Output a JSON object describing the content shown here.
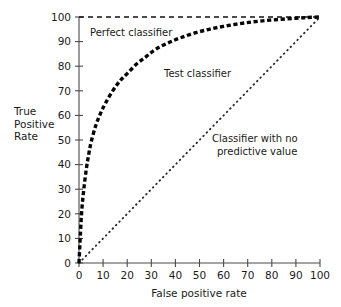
{
  "chart_data": {
    "type": "line",
    "title": "",
    "xlabel": "False positive rate",
    "ylabel": "True Positive Rate",
    "ylabel_lines": [
      "True",
      "Positive",
      "Rate"
    ],
    "xlim": [
      0,
      100
    ],
    "ylim": [
      0,
      100
    ],
    "xticks": [
      0,
      10,
      20,
      30,
      40,
      50,
      60,
      70,
      80,
      90,
      100
    ],
    "yticks": [
      0,
      10,
      20,
      30,
      40,
      50,
      60,
      70,
      80,
      90,
      100
    ],
    "xtick_labels": [
      "0",
      "10",
      "20",
      "30",
      "40",
      "50",
      "60",
      "70",
      "80",
      "90",
      "100"
    ],
    "ytick_labels": [
      "0",
      "10",
      "20",
      "30",
      "40",
      "50",
      "60",
      "70",
      "80",
      "90",
      "100"
    ],
    "grid": false,
    "legend_position": "inline-annotations",
    "series": [
      {
        "name": "Perfect classifier",
        "style": "dashed",
        "color": "#111111",
        "x": [
          0,
          100
        ],
        "y": [
          100,
          100
        ]
      },
      {
        "name": "Test classifier",
        "style": "thick-dashed",
        "color": "#050505",
        "x": [
          0,
          0.6,
          1.2,
          2,
          3,
          4,
          5,
          7,
          9,
          11,
          14,
          17,
          20,
          24,
          28,
          32,
          37,
          42,
          48,
          54,
          60,
          66,
          72,
          78,
          84,
          90,
          95,
          100
        ],
        "y": [
          0,
          12,
          22,
          30,
          38,
          44,
          49,
          56,
          61,
          65,
          70,
          74,
          77,
          81,
          84,
          87,
          89.5,
          91.5,
          93.5,
          95,
          96.2,
          97.2,
          98,
          98.6,
          99.1,
          99.5,
          99.8,
          100
        ]
      },
      {
        "name": "Classifier with no predictive value",
        "style": "dotted",
        "color": "#2b2b2b",
        "x": [
          0,
          100
        ],
        "y": [
          0,
          100
        ]
      }
    ],
    "annotations": [
      {
        "id": "perfect-classifier-label",
        "text": "Perfect classifier",
        "lines": [
          "Perfect classifier"
        ],
        "x": 4,
        "y": 96
      },
      {
        "id": "test-classifier-label",
        "text": "Test classifier",
        "lines": [
          "Test classifier"
        ],
        "x": 36,
        "y": 78
      },
      {
        "id": "chance-classifier-label",
        "text": "Classifier with no predictive value",
        "lines": [
          "Classifier with no",
          "predictive value"
        ],
        "x": 56,
        "y": 52
      }
    ]
  }
}
